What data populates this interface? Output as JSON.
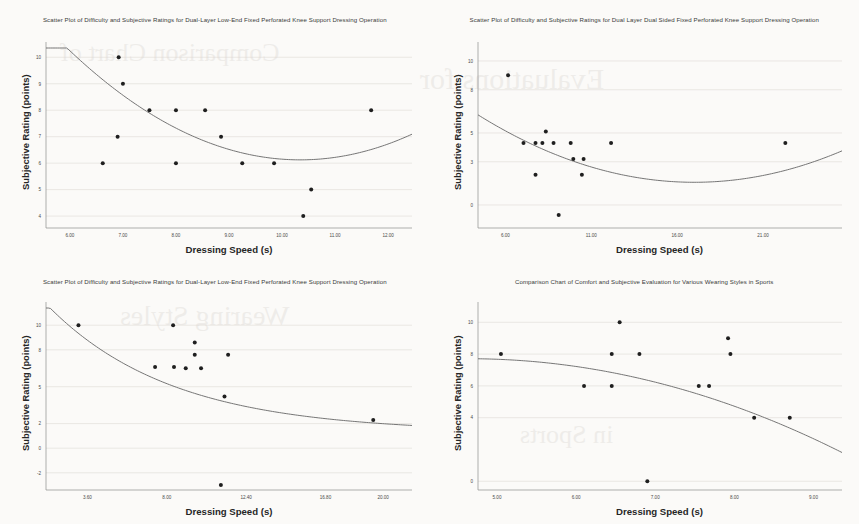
{
  "page": {
    "background_color": "#fbfaf8",
    "bleed_through_lines": [
      "Comparison Chart of",
      "Evaluations for",
      "Wearing Styles",
      "in Sports"
    ]
  },
  "panels": [
    {
      "id": "top-left",
      "title": "Scatter Plot of Difficulty and Subjective Ratings for Dual-Layer Low-End Fixed Perforated Knee Support Dressing Operation",
      "chart_data": {
        "type": "scatter",
        "title": "Scatter Plot of Difficulty and Subjective Ratings for Dual-Layer Low-End Fixed Perforated Knee Support Dressing Operation",
        "xlabel": "Dressing Speed (s)",
        "ylabel": "Subjective Rating (points)",
        "xlim": [
          5.55,
          12.45
        ],
        "ylim": [
          3.55,
          10.35
        ],
        "xticks": [
          6.0,
          7.0,
          8.0,
          9.0,
          10.0,
          11.0,
          12.0
        ],
        "xticklabels": [
          "6.00",
          "7.00",
          "8.00",
          "9.00",
          "10.00",
          "11.00",
          "12.00"
        ],
        "yticks": [
          4,
          5,
          6,
          7,
          8,
          9,
          10
        ],
        "yticklabels": [
          "4",
          "5",
          "6",
          "7",
          "8",
          "9",
          "10"
        ],
        "grid": true,
        "legend": "none",
        "points": [
          {
            "x": 6.92,
            "y": 10
          },
          {
            "x": 7.0,
            "y": 9
          },
          {
            "x": 7.5,
            "y": 8
          },
          {
            "x": 8.0,
            "y": 8
          },
          {
            "x": 8.55,
            "y": 8
          },
          {
            "x": 11.68,
            "y": 8
          },
          {
            "x": 6.9,
            "y": 7
          },
          {
            "x": 8.85,
            "y": 7
          },
          {
            "x": 6.62,
            "y": 6
          },
          {
            "x": 8.0,
            "y": 6
          },
          {
            "x": 9.25,
            "y": 6
          },
          {
            "x": 9.85,
            "y": 6
          },
          {
            "x": 10.55,
            "y": 5
          },
          {
            "x": 10.4,
            "y": 4
          }
        ],
        "fit": {
          "kind": "quadratic",
          "description": "downward then upward U-shaped quadratic fit, minimum near x=10.3, y=6.1",
          "a": 0.2185,
          "b": -4.52,
          "c": 29.5
        }
      }
    },
    {
      "id": "top-right",
      "title": "Scatter Plot of Difficulty and Subjective Ratings for Dual Layer Dual Sided Fixed Perforated Knee Support Dressing Operation",
      "chart_data": {
        "type": "scatter",
        "title": "Scatter Plot of Difficulty and Subjective Ratings for Dual Layer Dual Sided Fixed Perforated Knee Support Dressing Operation",
        "xlabel": "Dressing Speed (s)",
        "ylabel": "Subjective Rating (points)",
        "xlim": [
          4.4,
          25.6
        ],
        "ylim": [
          -1.6,
          10.9
        ],
        "xticks": [
          6.0,
          11.0,
          16.0,
          21.0
        ],
        "xticklabels": [
          "6.00",
          "11.00",
          "16.00",
          "21.00"
        ],
        "yticks": [
          0,
          3,
          5,
          8,
          10
        ],
        "yticklabels": [
          "0",
          "3",
          "5",
          "8",
          "10"
        ],
        "grid": true,
        "legend": "none",
        "points": [
          {
            "x": 6.15,
            "y": 9.0
          },
          {
            "x": 8.35,
            "y": 5.1
          },
          {
            "x": 7.05,
            "y": 4.3
          },
          {
            "x": 7.75,
            "y": 4.3
          },
          {
            "x": 8.15,
            "y": 4.3
          },
          {
            "x": 8.8,
            "y": 4.3
          },
          {
            "x": 9.8,
            "y": 4.3
          },
          {
            "x": 12.15,
            "y": 4.3
          },
          {
            "x": 22.3,
            "y": 4.3
          },
          {
            "x": 9.95,
            "y": 3.2
          },
          {
            "x": 10.55,
            "y": 3.2
          },
          {
            "x": 7.75,
            "y": 2.1
          },
          {
            "x": 10.45,
            "y": 2.1
          },
          {
            "x": 9.1,
            "y": -0.7
          }
        ],
        "fit": {
          "kind": "quadratic",
          "description": "U-shaped quadratic fit, minimum near x=17, y=1.6",
          "a": 0.0295,
          "b": -1.003,
          "c": 10.1
        }
      }
    },
    {
      "id": "bottom-left",
      "title": "Scatter Plot of Difficulty and Subjective Ratings for Dual-Layer Low-End Fixed Perforated Knee Support Dressing Operation",
      "chart_data": {
        "type": "scatter",
        "title": "Scatter Plot of Difficulty and Subjective Ratings for Dual-Layer Low-End Fixed Perforated Knee Support Dressing Operation",
        "xlabel": "Dressing Speed (s)",
        "ylabel": "Subjective Rating (points)",
        "xlim": [
          1.3,
          21.6
        ],
        "ylim": [
          -3.4,
          11.4
        ],
        "xticks": [
          3.6,
          8.0,
          12.4,
          16.8,
          20.0
        ],
        "xticklabels": [
          "3.60",
          "8.00",
          "12.40",
          "16.80",
          "20.00"
        ],
        "yticks": [
          -2,
          0,
          2,
          5,
          8,
          10
        ],
        "yticklabels": [
          "-2",
          "0",
          "2",
          "5",
          "8",
          "10"
        ],
        "grid": true,
        "legend": "none",
        "points": [
          {
            "x": 3.1,
            "y": 10.0
          },
          {
            "x": 8.35,
            "y": 10.0
          },
          {
            "x": 9.55,
            "y": 8.6
          },
          {
            "x": 9.55,
            "y": 7.6
          },
          {
            "x": 11.4,
            "y": 7.6
          },
          {
            "x": 7.35,
            "y": 6.6
          },
          {
            "x": 8.4,
            "y": 6.6
          },
          {
            "x": 9.05,
            "y": 6.5
          },
          {
            "x": 9.9,
            "y": 6.5
          },
          {
            "x": 11.2,
            "y": 4.2
          },
          {
            "x": 11.0,
            "y": -3.0
          },
          {
            "x": 19.45,
            "y": 2.3
          }
        ],
        "fit": {
          "kind": "exponential-decay",
          "description": "monotonically decaying curve from ~11 at left edge flattening toward ~1.5 at right edge",
          "asymptote": 1.3,
          "amplitude": 12.6,
          "rate": 0.145
        }
      }
    },
    {
      "id": "bottom-right",
      "title": "Comparison Chart of Comfort and Subjective Evaluation for Various Wearing Styles in Sports",
      "chart_data": {
        "type": "scatter",
        "title": "Comparison Chart of Comfort and Subjective Evaluation for Various Wearing Styles in Sports",
        "xlabel": "Dressing Speed (s)",
        "ylabel": "Subjective Rating (points)",
        "xlim": [
          4.76,
          9.36
        ],
        "ylim": [
          -0.55,
          10.9
        ],
        "xticks": [
          5.0,
          6.0,
          7.0,
          8.0,
          9.0
        ],
        "xticklabels": [
          "5.00",
          "6.00",
          "7.00",
          "8.00",
          "9.00"
        ],
        "yticks": [
          0,
          4,
          6,
          8,
          10
        ],
        "yticklabels": [
          "0",
          "4",
          "6",
          "8",
          "10"
        ],
        "grid": true,
        "legend": "none",
        "points": [
          {
            "x": 6.55,
            "y": 10
          },
          {
            "x": 7.92,
            "y": 9
          },
          {
            "x": 5.05,
            "y": 8
          },
          {
            "x": 6.45,
            "y": 8
          },
          {
            "x": 6.8,
            "y": 8
          },
          {
            "x": 7.95,
            "y": 8
          },
          {
            "x": 6.1,
            "y": 6
          },
          {
            "x": 6.45,
            "y": 6
          },
          {
            "x": 7.55,
            "y": 6
          },
          {
            "x": 7.68,
            "y": 6
          },
          {
            "x": 8.25,
            "y": 4
          },
          {
            "x": 8.7,
            "y": 4
          },
          {
            "x": 6.9,
            "y": 0
          }
        ],
        "fit": {
          "kind": "concave-quadratic",
          "description": "gently declining concave curve starting near 7.6 and falling to about 4.1 at the right edge",
          "a": -0.265,
          "b": 2.46,
          "c": 2.0
        }
      }
    }
  ],
  "labels": {
    "xlabel": "Dressing Speed (s)",
    "ylabel": "Subjective Rating (points)"
  }
}
